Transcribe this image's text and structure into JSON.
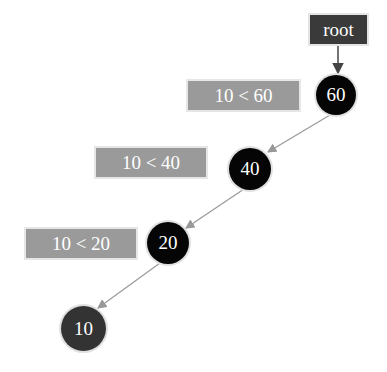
{
  "diagram": {
    "type": "binary-search-tree-insertion",
    "root_label": "root",
    "nodes": [
      {
        "id": "n60",
        "value": "60",
        "color": "#050505"
      },
      {
        "id": "n40",
        "value": "40",
        "color": "#050505"
      },
      {
        "id": "n20",
        "value": "20",
        "color": "#050505"
      },
      {
        "id": "n10",
        "value": "10",
        "color": "#333333"
      }
    ],
    "comparisons": [
      {
        "label": "10 < 60"
      },
      {
        "label": "10 < 40"
      },
      {
        "label": "10 < 20"
      }
    ],
    "edges": [
      {
        "from": "root",
        "to": "60"
      },
      {
        "from": "60",
        "to": "40"
      },
      {
        "from": "40",
        "to": "20"
      },
      {
        "from": "20",
        "to": "10"
      }
    ],
    "colors": {
      "root_box": "#3a3a3a",
      "comparison_box": "#9a9a9a",
      "edge": "#999999",
      "root_arrow": "#444444"
    }
  }
}
